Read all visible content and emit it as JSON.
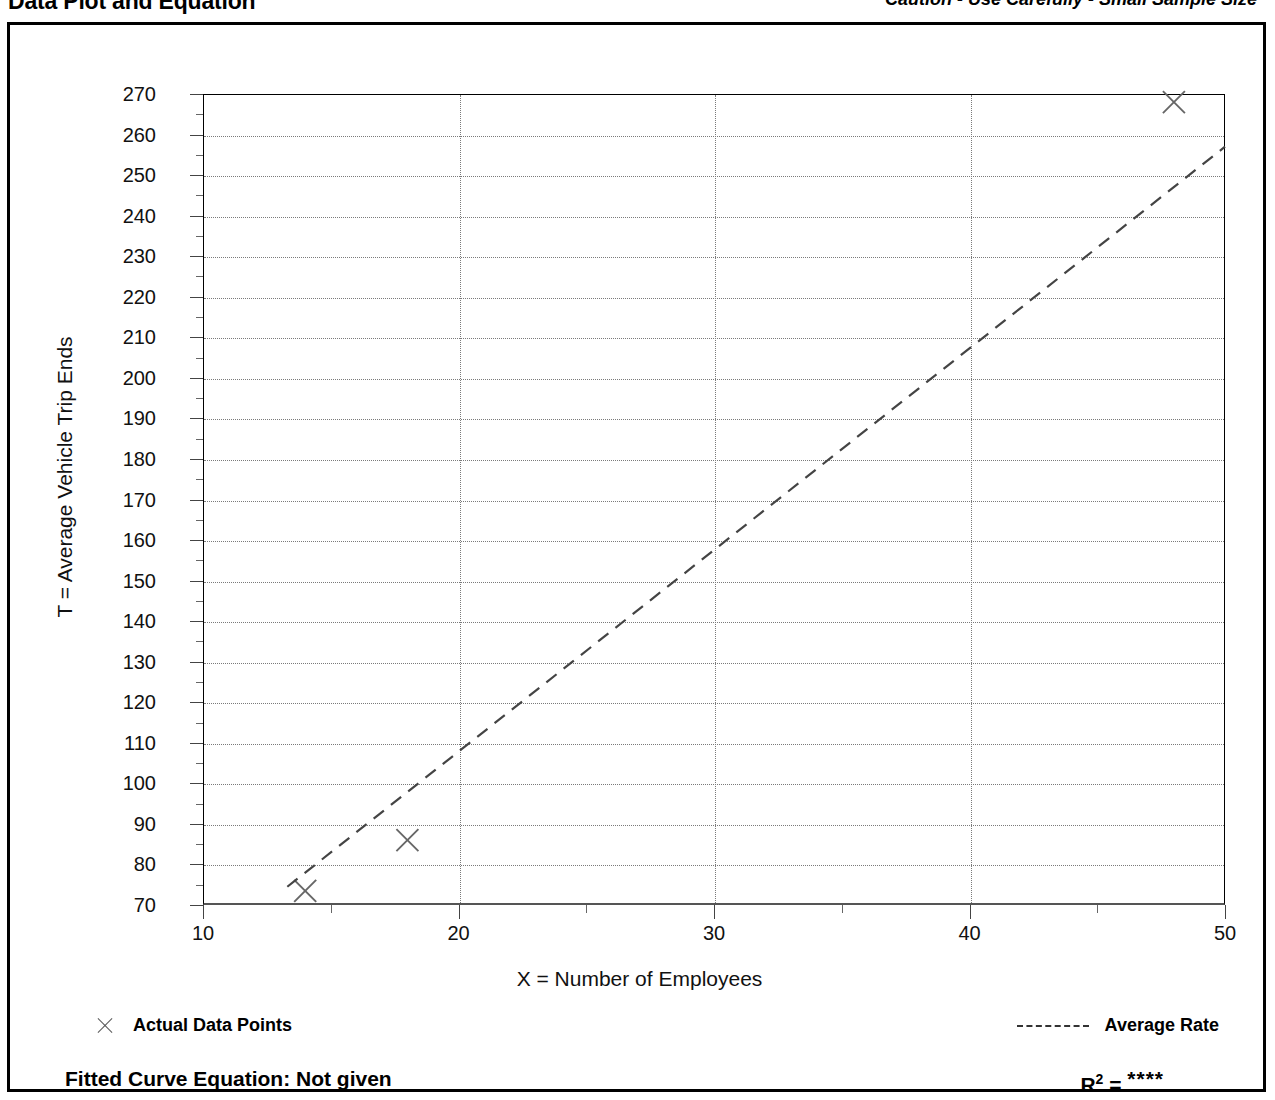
{
  "header": {
    "title": "Data Plot and Equation",
    "caution": "Caution - Use Carefully - Small Sample Size"
  },
  "legend": {
    "points_label": "Actual Data Points",
    "points_marker": "x-marker-icon",
    "rate_label": "Average Rate",
    "rate_marker": "dashed-line-icon"
  },
  "footer": {
    "fitted_curve_label": "Fitted Curve Equation:  Not given",
    "r2_label": "R",
    "r2_exponent": "2",
    "r2_equals": " = ",
    "r2_value": "****"
  },
  "chart_data": {
    "type": "scatter",
    "title": "Data Plot and Equation",
    "xlabel": "X = Number of Employees",
    "ylabel": "T = Average Vehicle Trip Ends",
    "xlim": [
      10,
      50
    ],
    "ylim": [
      70,
      270
    ],
    "grid": true,
    "x_ticks": [
      10,
      20,
      30,
      40,
      50
    ],
    "x_minor_ticks": [
      15,
      25,
      35,
      45
    ],
    "y_ticks": [
      70,
      80,
      90,
      100,
      110,
      120,
      130,
      140,
      150,
      160,
      170,
      180,
      190,
      200,
      210,
      220,
      230,
      240,
      250,
      260,
      270
    ],
    "series": [
      {
        "name": "Actual Data Points",
        "type": "scatter",
        "marker": "x",
        "points": [
          {
            "x": 14,
            "y": 73.5
          },
          {
            "x": 18,
            "y": 86
          },
          {
            "x": 48,
            "y": 268
          }
        ]
      },
      {
        "name": "Average Rate",
        "type": "line",
        "style": "dashed",
        "points": [
          {
            "x": 13.3,
            "y": 74.5
          },
          {
            "x": 50,
            "y": 257
          }
        ]
      }
    ],
    "legend_position": "bottom"
  }
}
